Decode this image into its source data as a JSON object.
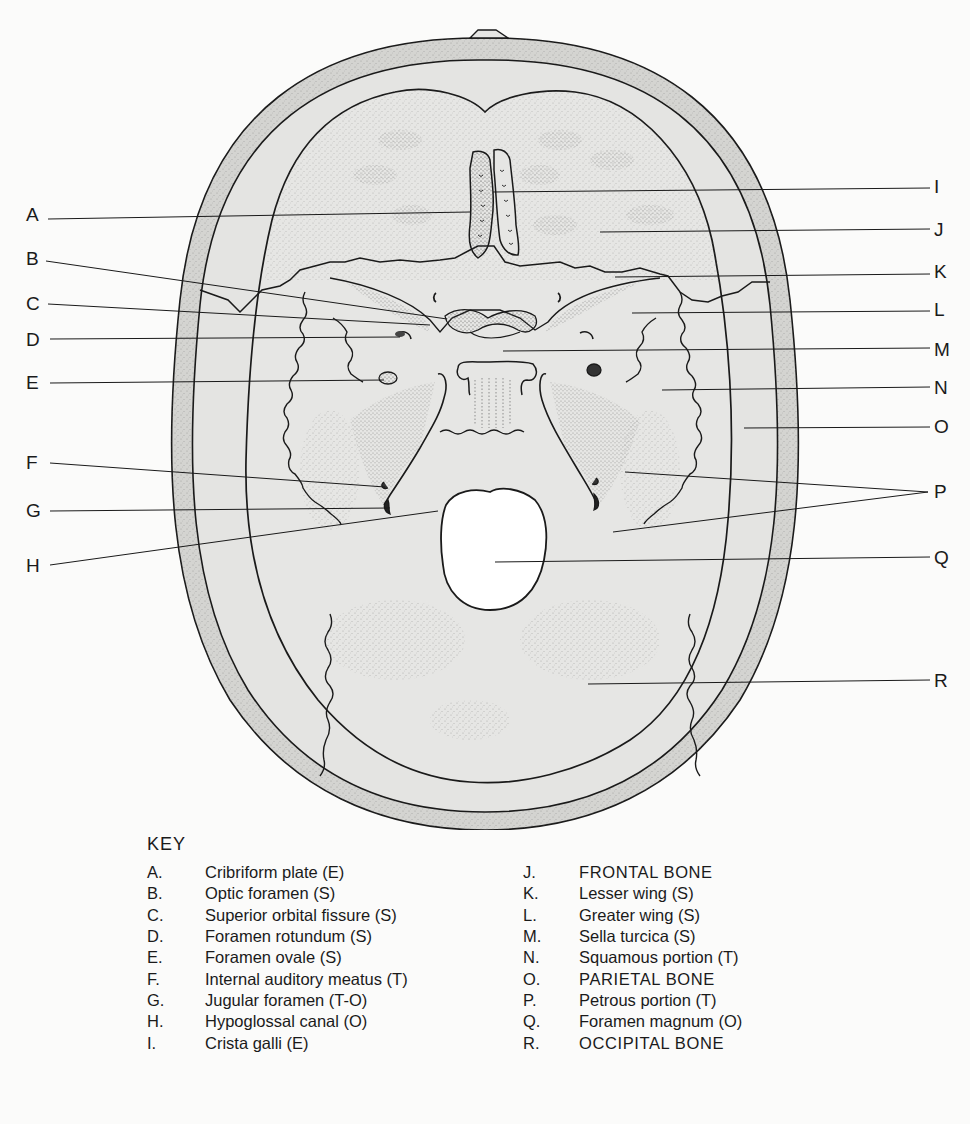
{
  "figure": {
    "callouts_left": [
      {
        "letter": "A",
        "y": 214
      },
      {
        "letter": "B",
        "y": 258
      },
      {
        "letter": "C",
        "y": 303
      },
      {
        "letter": "D",
        "y": 339
      },
      {
        "letter": "E",
        "y": 382
      },
      {
        "letter": "F",
        "y": 462
      },
      {
        "letter": "G",
        "y": 510
      },
      {
        "letter": "H",
        "y": 565
      }
    ],
    "callouts_right": [
      {
        "letter": "I",
        "y": 186
      },
      {
        "letter": "J",
        "y": 229
      },
      {
        "letter": "K",
        "y": 271
      },
      {
        "letter": "L",
        "y": 309
      },
      {
        "letter": "M",
        "y": 349
      },
      {
        "letter": "N",
        "y": 387
      },
      {
        "letter": "O",
        "y": 426
      },
      {
        "letter": "P",
        "y": 491
      },
      {
        "letter": "Q",
        "y": 557
      },
      {
        "letter": "R",
        "y": 680
      }
    ]
  },
  "key": {
    "title": "KEY",
    "column1": [
      {
        "letter": "A.",
        "text": "Cribriform plate (E)"
      },
      {
        "letter": "B.",
        "text": "Optic foramen (S)"
      },
      {
        "letter": "C.",
        "text": "Superior orbital fissure (S)"
      },
      {
        "letter": "D.",
        "text": "Foramen rotundum (S)"
      },
      {
        "letter": "E.",
        "text": "Foramen ovale (S)"
      },
      {
        "letter": "F.",
        "text": "Internal auditory meatus (T)"
      },
      {
        "letter": "G.",
        "text": "Jugular foramen (T-O)"
      },
      {
        "letter": "H.",
        "text": "Hypoglossal canal (O)"
      },
      {
        "letter": "I.",
        "text": "Crista galli (E)"
      }
    ],
    "column2": [
      {
        "letter": "J.",
        "text": "FRONTAL BONE"
      },
      {
        "letter": "K.",
        "text": "Lesser wing (S)"
      },
      {
        "letter": "L.",
        "text": "Greater wing (S)"
      },
      {
        "letter": "M.",
        "text": "Sella turcica (S)"
      },
      {
        "letter": "N.",
        "text": "Squamous portion (T)"
      },
      {
        "letter": "O.",
        "text": "PARIETAL BONE"
      },
      {
        "letter": "P.",
        "text": "Petrous portion (T)"
      },
      {
        "letter": "Q.",
        "text": "Foramen magnum (O)"
      },
      {
        "letter": "R.",
        "text": "OCCIPITAL BONE"
      }
    ]
  },
  "colors": {
    "background": "#fbfbfa",
    "bone_fill": "#e6e6e4",
    "outer_table": "#d2d2cf",
    "line": "#1a1a1a",
    "foramen_magnum": "#ffffff"
  }
}
